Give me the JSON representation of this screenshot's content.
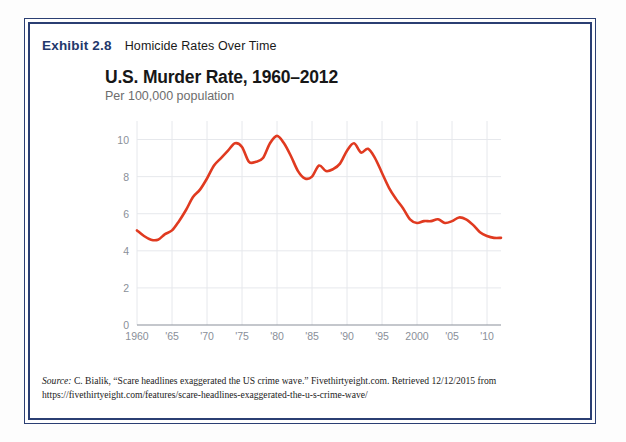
{
  "exhibit": {
    "label": "Exhibit 2.8",
    "title": "Homicide Rates Over Time"
  },
  "colors": {
    "frame_navy": "#2b3f73",
    "label_navy": "#23386b",
    "line_red": "#e03a20",
    "grid": "#e6e8ec",
    "axis": "#8a8f99",
    "tick_text": "#8a8f99",
    "subtitle_gray": "#6d6d6d"
  },
  "chart_data": {
    "type": "line",
    "title": "U.S. Murder Rate, 1960–2012",
    "subtitle": "Per 100,000 population",
    "xlabel": "",
    "ylabel": "",
    "ylim": [
      0,
      11
    ],
    "xlim": [
      1960,
      2012
    ],
    "grid": true,
    "legend": false,
    "ytick_labels": [
      "0",
      "2",
      "4",
      "6",
      "8",
      "10"
    ],
    "ytick_values": [
      0,
      2,
      4,
      6,
      8,
      10
    ],
    "xtick_labels": [
      "1960",
      "'65",
      "'70",
      "'75",
      "'80",
      "'85",
      "'90",
      "'95",
      "2000",
      "'05",
      "'10"
    ],
    "xtick_values": [
      1960,
      1965,
      1970,
      1975,
      1980,
      1985,
      1990,
      1995,
      2000,
      2005,
      2010
    ],
    "series": [
      {
        "name": "U.S. murder rate per 100,000",
        "color": "#e03a20",
        "x": [
          1960,
          1961,
          1962,
          1963,
          1964,
          1965,
          1966,
          1967,
          1968,
          1969,
          1970,
          1971,
          1972,
          1973,
          1974,
          1975,
          1976,
          1977,
          1978,
          1979,
          1980,
          1981,
          1982,
          1983,
          1984,
          1985,
          1986,
          1987,
          1988,
          1989,
          1990,
          1991,
          1992,
          1993,
          1994,
          1995,
          1996,
          1997,
          1998,
          1999,
          2000,
          2001,
          2002,
          2003,
          2004,
          2005,
          2006,
          2007,
          2008,
          2009,
          2010,
          2011,
          2012
        ],
        "values": [
          5.1,
          4.8,
          4.6,
          4.6,
          4.9,
          5.1,
          5.6,
          6.2,
          6.9,
          7.3,
          7.9,
          8.6,
          9.0,
          9.4,
          9.8,
          9.6,
          8.8,
          8.8,
          9.0,
          9.8,
          10.2,
          9.8,
          9.1,
          8.3,
          7.9,
          8.0,
          8.6,
          8.3,
          8.4,
          8.7,
          9.4,
          9.8,
          9.3,
          9.5,
          9.0,
          8.2,
          7.4,
          6.8,
          6.3,
          5.7,
          5.5,
          5.6,
          5.6,
          5.7,
          5.5,
          5.6,
          5.8,
          5.7,
          5.4,
          5.0,
          4.8,
          4.7,
          4.7
        ]
      }
    ]
  },
  "source": {
    "label": "Source:",
    "text": " C. Bialik, “Scare headlines exaggerated the US crime wave.” Fivethirtyeight.com. Retrieved 12/12/2015 from https://fivethirtyeight.com/features/scare-headlines-exaggerated-the-u-s-crime-wave/"
  }
}
